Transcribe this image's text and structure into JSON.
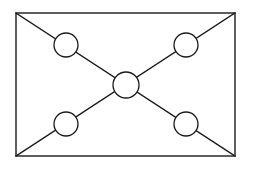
{
  "figure": {
    "canvas": {
      "width": 253,
      "height": 171,
      "background": "#ffffff"
    },
    "stroke": {
      "color": "#1a1a1a",
      "width": 1.3,
      "circle_width": 1.3
    },
    "fill": {
      "node": "#ffffff",
      "frame": "#ffffff"
    }
  },
  "frame": {
    "name": "outer-rectangle",
    "x": 16,
    "y": 13,
    "width": 219,
    "height": 143,
    "corners": {
      "top_left": [
        16,
        13
      ],
      "top_right": [
        235,
        13
      ],
      "bottom_right": [
        235,
        156
      ],
      "bottom_left": [
        16,
        156
      ]
    }
  },
  "diagonals": [
    {
      "name": "diagonal-tl-br",
      "x1": 16,
      "y1": 13,
      "x2": 235,
      "y2": 156
    },
    {
      "name": "diagonal-tr-bl",
      "x1": 235,
      "y1": 13,
      "x2": 16,
      "y2": 156
    }
  ],
  "nodes": [
    {
      "id": "node-top-left",
      "label": "",
      "cx": 66,
      "cy": 45,
      "r": 12
    },
    {
      "id": "node-top-right",
      "label": "",
      "cx": 186,
      "cy": 45,
      "r": 12
    },
    {
      "id": "node-center",
      "label": "",
      "cx": 126,
      "cy": 85,
      "r": 13
    },
    {
      "id": "node-bottom-left",
      "label": "",
      "cx": 66,
      "cy": 124,
      "r": 12
    },
    {
      "id": "node-bottom-right",
      "label": "",
      "cx": 186,
      "cy": 124,
      "r": 12
    }
  ]
}
